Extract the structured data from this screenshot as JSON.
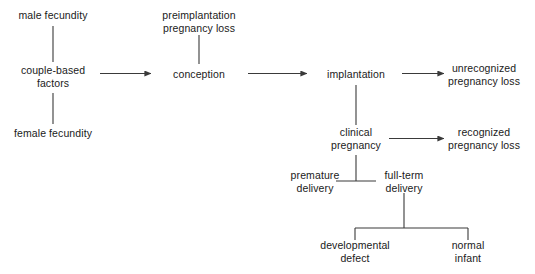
{
  "figure": {
    "background_color": "#ffffff",
    "line_color": "#3a3a3a",
    "text_color": "#1a1a1a",
    "width": 535,
    "height": 274
  },
  "nodes": [
    {
      "id": "male-fecundity",
      "label_lines": [
        "male fecundity"
      ],
      "cx": 53,
      "cy": 15
    },
    {
      "id": "couple-based-factors",
      "label_lines": [
        "couple-based",
        "factors"
      ],
      "cx": 53,
      "cy": 76
    },
    {
      "id": "female-fecundity",
      "label_lines": [
        "female fecundity"
      ],
      "cx": 53,
      "cy": 133
    },
    {
      "id": "preimplantation-loss",
      "label_lines": [
        "preimplantation",
        "pregnancy loss"
      ],
      "cx": 199,
      "cy": 21
    },
    {
      "id": "conception",
      "label_lines": [
        "conception"
      ],
      "cx": 199,
      "cy": 74
    },
    {
      "id": "implantation",
      "label_lines": [
        "implantation"
      ],
      "cx": 356,
      "cy": 74
    },
    {
      "id": "unrecognized-loss",
      "label_lines": [
        "unrecognized",
        "pregnancy loss"
      ],
      "cx": 484,
      "cy": 74
    },
    {
      "id": "clinical-pregnancy",
      "label_lines": [
        "clinical",
        "pregnancy"
      ],
      "cx": 356,
      "cy": 138
    },
    {
      "id": "recognized-loss",
      "label_lines": [
        "recognized",
        "pregnancy loss"
      ],
      "cx": 484,
      "cy": 138
    },
    {
      "id": "premature-delivery",
      "label_lines": [
        "premature",
        "delivery"
      ],
      "cx": 315,
      "cy": 181
    },
    {
      "id": "full-term-delivery",
      "label_lines": [
        "full-term",
        "delivery"
      ],
      "cx": 404,
      "cy": 181
    },
    {
      "id": "developmental-defect",
      "label_lines": [
        "developmental",
        "defect"
      ],
      "cx": 355,
      "cy": 251
    },
    {
      "id": "normal-infant",
      "label_lines": [
        "normal",
        "infant"
      ],
      "cx": 468,
      "cy": 251
    }
  ],
  "connectors": [
    {
      "id": "male-to-couple",
      "kind": "line",
      "from": "male-fecundity",
      "to": "couple-based-factors"
    },
    {
      "id": "couple-to-female",
      "kind": "line",
      "from": "couple-based-factors",
      "to": "female-fecundity"
    },
    {
      "id": "couple-to-conception",
      "kind": "arrow",
      "from": "couple-based-factors",
      "to": "conception"
    },
    {
      "id": "preimplantation-to-conception",
      "kind": "line",
      "from": "preimplantation-loss",
      "to": "conception"
    },
    {
      "id": "conception-to-implantation",
      "kind": "arrow",
      "from": "conception",
      "to": "implantation"
    },
    {
      "id": "implantation-to-unrecognized",
      "kind": "arrow",
      "from": "implantation",
      "to": "unrecognized-loss"
    },
    {
      "id": "implantation-to-clinical",
      "kind": "line",
      "from": "implantation",
      "to": "clinical-pregnancy"
    },
    {
      "id": "clinical-to-recognized",
      "kind": "arrow",
      "from": "clinical-pregnancy",
      "to": "recognized-loss"
    },
    {
      "id": "clinical-to-deliveries",
      "kind": "split",
      "from": "clinical-pregnancy",
      "to": [
        "premature-delivery",
        "full-term-delivery"
      ]
    },
    {
      "id": "fullterm-to-outcomes",
      "kind": "split",
      "from": "full-term-delivery",
      "to": [
        "developmental-defect",
        "normal-infant"
      ]
    }
  ]
}
